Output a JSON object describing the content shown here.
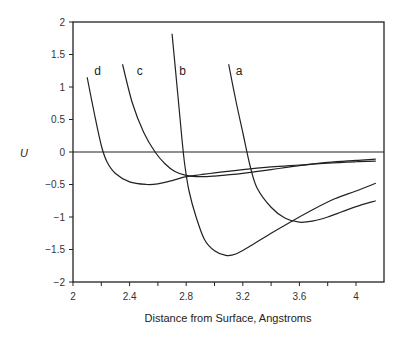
{
  "chart_data": {
    "type": "line",
    "title": "",
    "xlabel": "Distance from Surface, Angstroms",
    "ylabel": "U",
    "xlim": [
      2,
      4.15
    ],
    "ylim": [
      -2,
      2
    ],
    "x_ticks": [
      "2",
      "2.4",
      "2.8",
      "3.2",
      "3.6",
      "4"
    ],
    "x_minor_ticks": [
      2.2,
      2.6,
      3.0,
      3.4,
      3.8
    ],
    "y_ticks": [
      "2",
      "1.5",
      "1",
      "0.5",
      "0",
      "-0.5",
      "-1",
      "-1.5",
      "-2"
    ],
    "grid": false,
    "zero_line": true,
    "legend": "inline labels",
    "series": [
      {
        "name": "a",
        "points": [
          [
            3.1,
            1.35
          ],
          [
            3.15,
            0.8
          ],
          [
            3.2,
            0.3
          ],
          [
            3.25,
            -0.2
          ],
          [
            3.3,
            -0.55
          ],
          [
            3.4,
            -0.85
          ],
          [
            3.5,
            -1.02
          ],
          [
            3.6,
            -1.08
          ],
          [
            3.7,
            -1.06
          ],
          [
            3.8,
            -1.0
          ],
          [
            3.9,
            -0.92
          ],
          [
            4.0,
            -0.84
          ],
          [
            4.14,
            -0.75
          ]
        ]
      },
      {
        "name": "b",
        "points": [
          [
            2.7,
            1.82
          ],
          [
            2.74,
            0.9
          ],
          [
            2.77,
            0.2
          ],
          [
            2.79,
            -0.2
          ],
          [
            2.82,
            -0.6
          ],
          [
            2.87,
            -1.0
          ],
          [
            2.93,
            -1.35
          ],
          [
            3.0,
            -1.52
          ],
          [
            3.08,
            -1.59
          ],
          [
            3.15,
            -1.57
          ],
          [
            3.25,
            -1.45
          ],
          [
            3.4,
            -1.25
          ],
          [
            3.55,
            -1.06
          ],
          [
            3.7,
            -0.88
          ],
          [
            3.85,
            -0.72
          ],
          [
            4.0,
            -0.6
          ],
          [
            4.14,
            -0.48
          ]
        ]
      },
      {
        "name": "c",
        "points": [
          [
            2.35,
            1.35
          ],
          [
            2.42,
            0.75
          ],
          [
            2.5,
            0.3
          ],
          [
            2.58,
            0.0
          ],
          [
            2.65,
            -0.18
          ],
          [
            2.72,
            -0.3
          ],
          [
            2.8,
            -0.36
          ],
          [
            2.9,
            -0.38
          ],
          [
            3.0,
            -0.37
          ],
          [
            3.2,
            -0.33
          ],
          [
            3.4,
            -0.27
          ],
          [
            3.6,
            -0.21
          ],
          [
            3.8,
            -0.16
          ],
          [
            4.0,
            -0.13
          ],
          [
            4.14,
            -0.11
          ]
        ]
      },
      {
        "name": "d",
        "points": [
          [
            2.1,
            1.15
          ],
          [
            2.15,
            0.6
          ],
          [
            2.2,
            0.1
          ],
          [
            2.24,
            -0.15
          ],
          [
            2.3,
            -0.33
          ],
          [
            2.4,
            -0.46
          ],
          [
            2.52,
            -0.5
          ],
          [
            2.6,
            -0.49
          ],
          [
            2.7,
            -0.44
          ],
          [
            2.8,
            -0.38
          ],
          [
            2.9,
            -0.35
          ],
          [
            3.0,
            -0.32
          ],
          [
            3.2,
            -0.27
          ],
          [
            3.4,
            -0.23
          ],
          [
            3.6,
            -0.2
          ],
          [
            3.8,
            -0.17
          ],
          [
            4.0,
            -0.15
          ],
          [
            4.14,
            -0.14
          ]
        ]
      }
    ],
    "labels": [
      {
        "text": "a",
        "x": 3.15,
        "y": 1.18
      },
      {
        "text": "b",
        "x": 2.75,
        "y": 1.18
      },
      {
        "text": "c",
        "x": 2.45,
        "y": 1.18
      },
      {
        "text": "d",
        "x": 2.15,
        "y": 1.18
      }
    ]
  }
}
